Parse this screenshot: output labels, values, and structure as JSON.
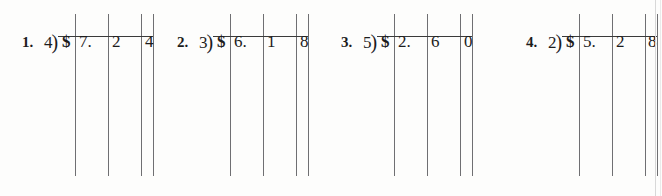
{
  "worksheet": {
    "kind": "long-division-money-practice",
    "background_color": "#fdfdfc",
    "ink_color": "#1c1c1c",
    "rule_color": "#6f6f72",
    "problem_count": 4,
    "problems": [
      {
        "index_label": "1.",
        "divisor": "4",
        "division_bracket": ")",
        "currency_symbol": "$",
        "dividend": "7.24",
        "digits": [
          "7.",
          "2",
          "4"
        ],
        "expression": "4)$7.24",
        "group_left": 22,
        "index_left": 22,
        "divisor_left": 44,
        "vinculum_left": 58,
        "vinculum_width": 95,
        "currency_left": 62,
        "digit_lefts": [
          79,
          112,
          145
        ],
        "rule_lefts": [
          75,
          108,
          141,
          153
        ]
      },
      {
        "index_label": "2.",
        "divisor": "3",
        "division_bracket": ")",
        "currency_symbol": "$",
        "dividend": "6.18",
        "digits": [
          "6.",
          "1",
          "8"
        ],
        "expression": "3)$6.18",
        "group_left": 177,
        "index_left": 177,
        "divisor_left": 199,
        "vinculum_left": 213,
        "vinculum_width": 95,
        "currency_left": 217,
        "digit_lefts": [
          234,
          267,
          300
        ],
        "rule_lefts": [
          230,
          263,
          296,
          308
        ]
      },
      {
        "index_label": "3.",
        "divisor": "5",
        "division_bracket": ")",
        "currency_symbol": "$",
        "dividend": "2.60",
        "digits": [
          "2.",
          "6",
          "0"
        ],
        "expression": "5)$2.60",
        "group_left": 341,
        "index_left": 341,
        "divisor_left": 363,
        "vinculum_left": 377,
        "vinculum_width": 95,
        "currency_left": 381,
        "digit_lefts": [
          398,
          431,
          464
        ],
        "rule_lefts": [
          394,
          427,
          460,
          472
        ]
      },
      {
        "index_label": "4.",
        "divisor": "2",
        "division_bracket": ")",
        "currency_symbol": "$",
        "dividend": "5.28",
        "digits": [
          "5.",
          "2",
          "8"
        ],
        "expression": "2)$5.28",
        "group_left": 526,
        "index_left": 526,
        "divisor_left": 548,
        "vinculum_left": 562,
        "vinculum_width": 95,
        "currency_left": 566,
        "digit_lefts": [
          583,
          616,
          648
        ],
        "rule_lefts": [
          579,
          612,
          645,
          657
        ]
      }
    ],
    "page_edges": [
      {
        "left": 655,
        "soft": false
      },
      {
        "left": 660,
        "soft": true
      }
    ]
  }
}
